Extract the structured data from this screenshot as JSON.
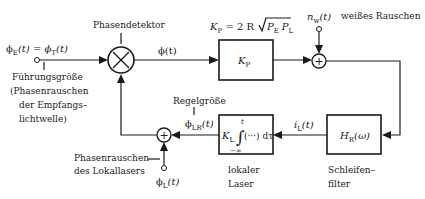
{
  "diagram": {
    "input": {
      "label_lhs": "ϕ",
      "label_lhs_sub": "E",
      "label_eq": "(t) = ϕ",
      "label_rhs_sub": "T",
      "label_rhs_end": "(t)",
      "caption_lines": [
        "Führungsgröße",
        "(Phasenrauschen",
        "der Empfangs–",
        "lichtwelle)"
      ]
    },
    "phase_detector": {
      "label": "Phasendetektor",
      "symbol": "×"
    },
    "phase_signal": {
      "label": "ϕ(t)"
    },
    "gain_block": {
      "label": "K",
      "label_sub": "P",
      "formula_prefix": "K",
      "formula_prefix_sub": "P",
      "formula_mid": " = 2 R ",
      "formula_sqrt_a": "P",
      "formula_sqrt_a_sub": "E",
      "formula_sqrt_b": "P",
      "formula_sqrt_b_sub": "L"
    },
    "noise_input": {
      "label": "n",
      "label_sub": "w",
      "label_end": "(t)",
      "caption": "weißes Rauschen"
    },
    "noise_adder": {
      "symbol": "+"
    },
    "loop_filter": {
      "label": "H",
      "label_sub": "R",
      "label_end": "(ω)",
      "caption_lines": [
        "Schleifen–",
        "filter"
      ]
    },
    "current_signal": {
      "label": "i",
      "label_sub": "L",
      "label_end": "(t)"
    },
    "local_laser": {
      "label_k": "K",
      "label_k_sub": "L",
      "integral": "∫",
      "integrand": "(···) dτ",
      "upper_limit": "t",
      "lower_limit": "−∞",
      "caption_lines": [
        "lokaler",
        "Laser"
      ]
    },
    "control_signal": {
      "caption": "Regelgröße",
      "label": "ϕ",
      "label_sub": "LR",
      "label_end": "(t)"
    },
    "feedback_adder": {
      "symbol": "+"
    },
    "local_noise": {
      "caption_lines": [
        "Phasenrauschen",
        "des Lokallasers"
      ],
      "label": "ϕ",
      "label_sub": "L",
      "label_end": "(t)"
    }
  }
}
